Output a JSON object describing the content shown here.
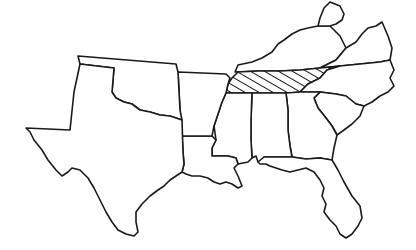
{
  "map": {
    "description": "Outline map of the southern United States (former Confederate states plus neighbors) with one state highlighted by diagonal hatching",
    "line_color": "#1a1a1a",
    "background": "#ffffff",
    "highlighted_state": "Tennessee",
    "highlight_style": "diagonal-hatch",
    "states": [
      {
        "id": "texas",
        "name": "Texas"
      },
      {
        "id": "oklahoma",
        "name": "Oklahoma"
      },
      {
        "id": "arkansas",
        "name": "Arkansas"
      },
      {
        "id": "louisiana",
        "name": "Louisiana"
      },
      {
        "id": "mississippi",
        "name": "Mississippi"
      },
      {
        "id": "alabama",
        "name": "Alabama"
      },
      {
        "id": "georgia",
        "name": "Georgia"
      },
      {
        "id": "florida",
        "name": "Florida"
      },
      {
        "id": "south-carolina",
        "name": "South Carolina"
      },
      {
        "id": "north-carolina",
        "name": "North Carolina"
      },
      {
        "id": "tennessee",
        "name": "Tennessee"
      },
      {
        "id": "kentucky",
        "name": "Kentucky"
      },
      {
        "id": "virginia",
        "name": "Virginia"
      },
      {
        "id": "west-virginia",
        "name": "West Virginia"
      }
    ]
  }
}
